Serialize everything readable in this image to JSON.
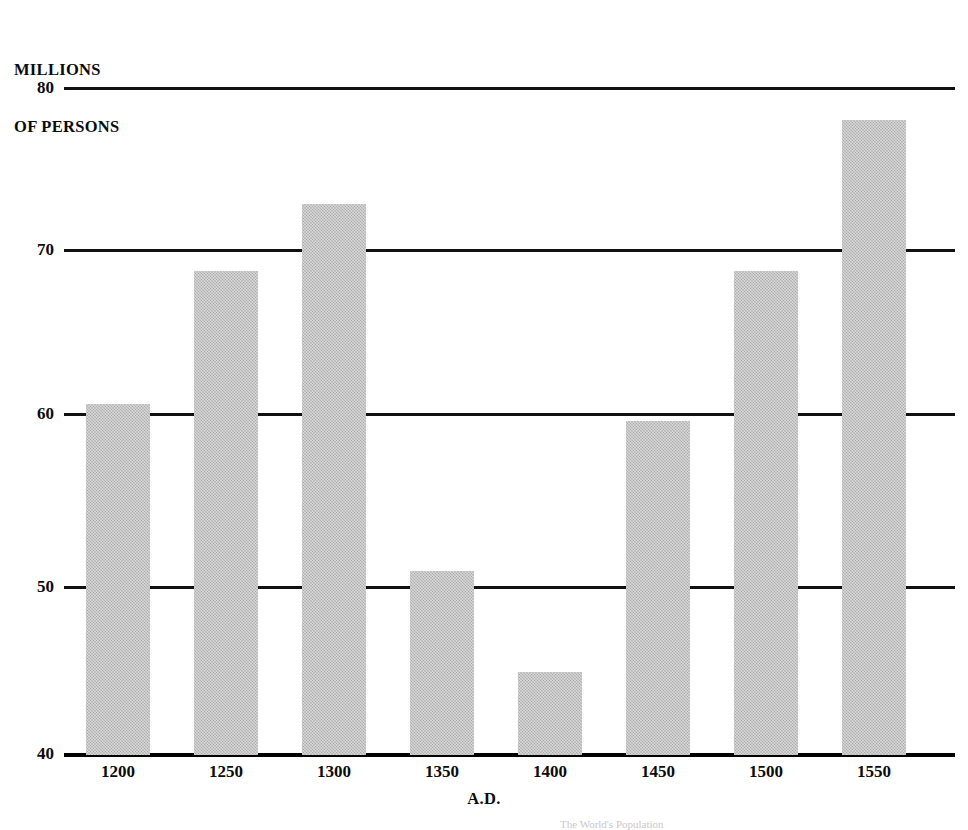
{
  "figure": {
    "background_color": "#ffffff",
    "ink_color": "#111111",
    "bar_color": "#b4b4b4"
  },
  "axes": {
    "y_title_line1": "MILLIONS",
    "y_title_line2": "OF PERSONS",
    "x_title": "A.D.",
    "y_ticks": [
      "80",
      "70",
      "60",
      "50",
      "40"
    ],
    "x_ticks": [
      "1200",
      "1250",
      "1300",
      "1350",
      "1400",
      "1450",
      "1500",
      "1550"
    ]
  },
  "source_caption": "The World's Population",
  "chart_data": {
    "type": "bar",
    "title": "MILLIONS OF PERSONS",
    "xlabel": "A.D.",
    "ylabel": "MILLIONS OF PERSONS",
    "categories": [
      "1200",
      "1250",
      "1300",
      "1350",
      "1400",
      "1450",
      "1500",
      "1550"
    ],
    "values": [
      61,
      69,
      73,
      51,
      45,
      60,
      69,
      78
    ],
    "ylim": [
      40,
      80
    ],
    "yticks": [
      40,
      50,
      60,
      70,
      80
    ],
    "grid": true,
    "grid_axis": "y",
    "legend": false,
    "legend_position": "none",
    "bar_color": "#b4b4b4",
    "series": [
      {
        "name": "Population",
        "values": [
          61,
          69,
          73,
          51,
          45,
          60,
          69,
          78
        ]
      }
    ]
  }
}
